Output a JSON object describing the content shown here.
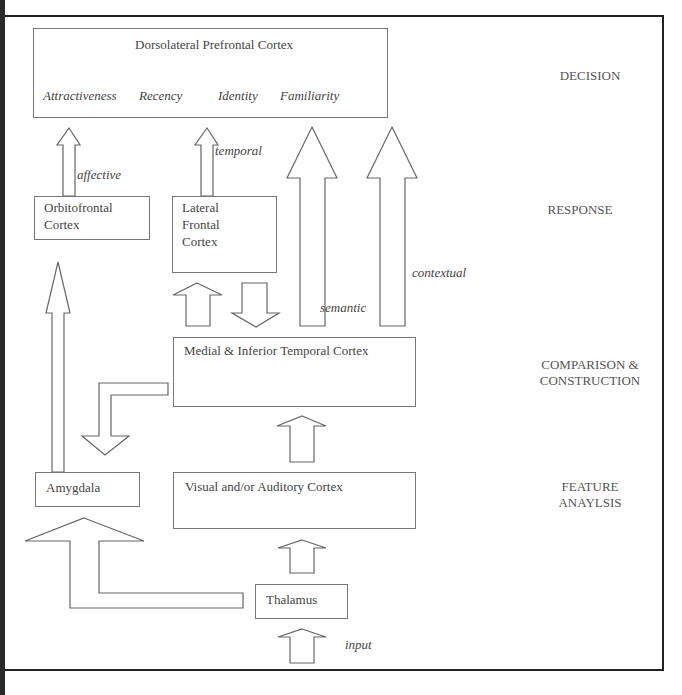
{
  "diagram": {
    "boxes": {
      "dlpfc": {
        "title": "Dorsolateral Prefrontal Cortex",
        "attributes": [
          "Attractiveness",
          "Recency",
          "Identity",
          "Familiarity"
        ]
      },
      "ofc": {
        "line1": "Orbitofrontal",
        "line2": "Cortex"
      },
      "lfc": {
        "line1": "Lateral",
        "line2": "Frontal",
        "line3": "Cortex"
      },
      "mitc": {
        "title": "Medial & Inferior Temporal Cortex"
      },
      "amygdala": {
        "title": "Amygdala"
      },
      "vac": {
        "title": "Visual and/or Auditory Cortex"
      },
      "thalamus": {
        "title": "Thalamus"
      }
    },
    "arrow_labels": {
      "affective": "affective",
      "temporal": "temporal",
      "semantic": "semantic",
      "contextual": "contextual",
      "input": "input"
    },
    "stages": {
      "decision": "DECISION",
      "response": "RESPONSE",
      "comparison_line1": "COMPARISON &",
      "comparison_line2": "CONSTRUCTION",
      "feature_line1": "FEATURE",
      "feature_line2": "ANAYLSIS"
    },
    "colors": {
      "frame": "#222222",
      "box_border": "#777777",
      "arrow_stroke": "#666666",
      "text": "#444444"
    }
  }
}
